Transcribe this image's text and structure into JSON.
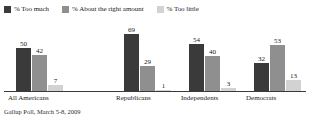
{
  "chart_data": {
    "type": "bar",
    "title": "",
    "subtitle": "",
    "xlabel": "",
    "ylabel": "",
    "ylim": [
      0,
      75
    ],
    "grid": false,
    "legend_position": "top-left",
    "categories": [
      "All Americans",
      "Republicans",
      "Independents",
      "Democrats"
    ],
    "series": [
      {
        "name": "% Too much",
        "color": "#3a3a3a",
        "values": [
          50,
          69,
          54,
          32
        ]
      },
      {
        "name": "% About the right amount",
        "color": "#8f8f8f",
        "values": [
          42,
          29,
          40,
          53
        ]
      },
      {
        "name": "% Too little",
        "color": "#d2d2d2",
        "values": [
          7,
          1,
          3,
          13
        ]
      }
    ],
    "source_note": "Gallup Poll, March 5-8, 2009"
  },
  "legend": {
    "items": [
      {
        "label": "% Too much",
        "color": "#3a3a3a"
      },
      {
        "label": "% About the right amount",
        "color": "#8f8f8f"
      },
      {
        "label": "% Too little",
        "color": "#d2d2d2"
      }
    ]
  },
  "footnote": {
    "text": "Gallup Poll, March 5-8, 2009"
  }
}
